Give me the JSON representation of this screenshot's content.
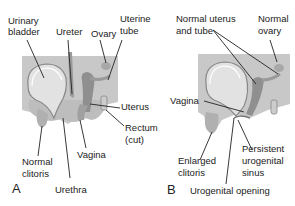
{
  "figure": {
    "panel_a": {
      "letter": "A",
      "labels": {
        "urinary_bladder": [
          "Urinary",
          "bladder"
        ],
        "ureter": "Ureter",
        "ovary": "Ovary",
        "uterine_tube": [
          "Uterine",
          "tube"
        ],
        "uterus": "Uterus",
        "rectum": [
          "Rectum",
          "(cut)"
        ],
        "vagina": "Vagina",
        "normal_clitoris": [
          "Normal",
          "clitoris"
        ],
        "urethra": "Urethra"
      }
    },
    "panel_b": {
      "letter": "B",
      "labels": {
        "normal_uterus_tube": [
          "Normal uterus",
          "and tube"
        ],
        "normal_ovary": [
          "Normal",
          "ovary"
        ],
        "vagina": "Vagina",
        "enlarged_clitoris": [
          "Enlarged",
          "clitoris"
        ],
        "persistent_sinus": [
          "Persistent",
          "urogenital",
          "sinus"
        ],
        "urogenital_opening": "Urogenital opening"
      }
    },
    "colors": {
      "background_block": "#c8c8c8",
      "organ_fill": "#b4b4b4",
      "organ_dark": "#8a8a8a",
      "bladder_light": "#e6e6e6",
      "text": "#222222"
    }
  }
}
